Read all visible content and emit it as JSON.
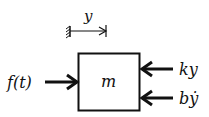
{
  "diagram": {
    "mass_label": "m",
    "displacement_label": "y",
    "input_force_label": "f(t)",
    "spring_force_label": "ky",
    "damper_force_label": "bẏ",
    "colors": {
      "stroke": "#111111",
      "background": "#ffffff"
    }
  }
}
